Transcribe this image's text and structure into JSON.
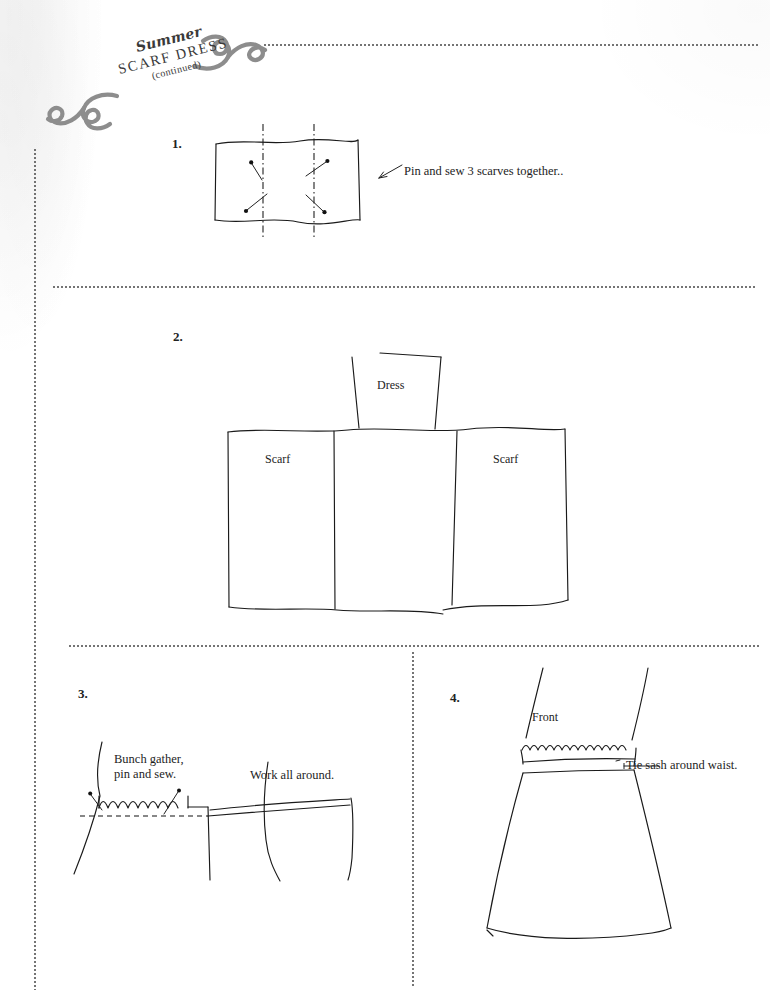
{
  "document": {
    "kind": "sewing-instruction-sheet",
    "header": {
      "eyebrow": "Summer",
      "title": "SCARF DRESS",
      "subtitle": "(continued)",
      "flourish_left": "scroll-flourish-icon",
      "flourish_right": "scroll-flourish-icon"
    },
    "ink_color": "#1a1a1a",
    "paper_color": "#ffffff",
    "rule_color": "#555555"
  },
  "steps": [
    {
      "number": "1.",
      "caption": "Pin and sew 3 scarves together..",
      "diagram": {
        "name": "three-scarves-pinned",
        "pins": 4,
        "seams": 2,
        "seam_style": "dash-dot"
      }
    },
    {
      "number": "2.",
      "labels": {
        "dress": "Dress",
        "scarf_left": "Scarf",
        "scarf_right": "Scarf"
      },
      "diagram": {
        "name": "scarf-panels-layout",
        "panels": 3
      }
    },
    {
      "number": "3.",
      "caption": "Bunch gather,\npin and sew.",
      "caption_right": "Work all around.",
      "diagram": {
        "name": "gathered-waist-detail",
        "ruffles": 7,
        "pins": 2
      }
    },
    {
      "number": "4.",
      "labels": {
        "front": "Front"
      },
      "caption": "Tie sash around waist.",
      "diagram": {
        "name": "finished-dress-front-view"
      }
    }
  ],
  "rules": {
    "top_divider": "dotted-horizontal-rule",
    "divider_after_step1": "dotted-horizontal-rule",
    "divider_after_step2": "dotted-horizontal-rule",
    "left_margin": "dotted-vertical-rule",
    "column_divider": "dotted-vertical-rule"
  }
}
